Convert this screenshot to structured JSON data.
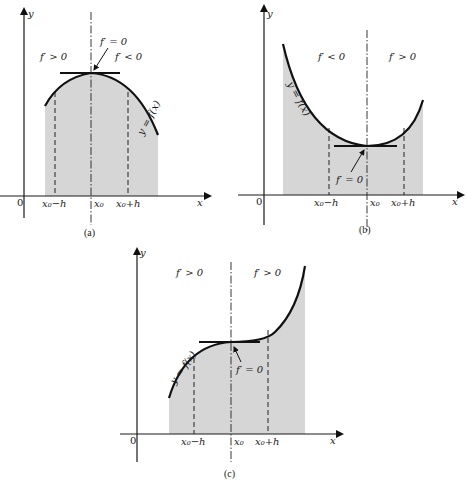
{
  "figure": {
    "panels": [
      {
        "id": "a",
        "caption": "(a)",
        "axis_y_label": "y",
        "axis_x_label": "x",
        "origin_label": "0",
        "tick_labels": {
          "left": "x₀−h",
          "center": "x₀",
          "right": "x₀+h"
        },
        "region_left": "f′ > 0",
        "region_right": "f′ < 0",
        "critical_label": "f′ = 0",
        "curve_label": "y = f(x)",
        "type": "local maximum"
      },
      {
        "id": "b",
        "caption": "(b)",
        "axis_y_label": "y",
        "axis_x_label": "x",
        "origin_label": "0",
        "tick_labels": {
          "left": "x₀−h",
          "center": "x₀",
          "right": "x₀+h"
        },
        "region_left": "f′ < 0",
        "region_right": "f′ > 0",
        "critical_label": "f′ = 0",
        "curve_label": "y = f(x)",
        "type": "local minimum"
      },
      {
        "id": "c",
        "caption": "(c)",
        "axis_y_label": "y",
        "axis_x_label": "x",
        "origin_label": "0",
        "tick_labels": {
          "left": "x₀−h",
          "center": "x₀",
          "right": "x₀+h"
        },
        "region_left": "f′ > 0",
        "region_right": "f′ > 0",
        "critical_label": "f′ = 0",
        "curve_label": "y = f(x)",
        "type": "horizontal inflection"
      }
    ],
    "colors": {
      "shading": "#d6d6d6",
      "ink": "#111111"
    }
  }
}
